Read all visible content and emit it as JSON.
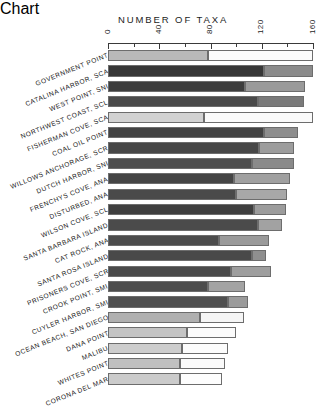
{
  "chart_data": {
    "type": "bar",
    "orientation": "horizontal",
    "stacked": true,
    "title": "NUMBER OF TAXA",
    "xlabel": "NUMBER OF TAXA",
    "ylabel": "",
    "xlim": [
      0,
      160
    ],
    "xticks": [
      0,
      40,
      80,
      120,
      160
    ],
    "xtick_labels": [
      "0",
      "40",
      "80",
      "120",
      "160"
    ],
    "minor_tick_interval": 20,
    "grid": false,
    "legend": "none",
    "categories": [
      "GOVERNMENT POINT",
      "CATALINA HARBOR, SCA",
      "WEST POINT, SNI",
      "NORTHWEST COAST, SCL",
      "FISHERMAN COVE, SCA",
      "COAL OIL POINT",
      "WILLOWS ANCHORAGE, SCR",
      "DUTCH HARBOR, SNI",
      "FRENCHYS COVE, ANA",
      "DISTURBED, ANA",
      "WILSON COVE, SCL",
      "SANTA BARBARA ISLAND",
      "CAT ROCK, ANA",
      "SANTA ROSA ISLAND",
      "PRISONERS COVE, SCR",
      "CROOK POINT, SMI",
      "CUYLER HARBOR, SMI",
      "OCEAN BEACH, SAN DIEGO",
      "DANA POINT",
      "MALIBU",
      "WHITES POINT",
      "CORONA DEL MAR"
    ],
    "series": [
      {
        "name": "segment-1",
        "values": [
          78,
          122,
          107,
          117,
          75,
          122,
          118,
          112,
          98,
          100,
          114,
          117,
          87,
          112,
          96,
          78,
          94,
          72,
          62,
          58,
          56,
          56
        ]
      },
      {
        "name": "segment-2",
        "values": [
          82,
          38,
          47,
          36,
          85,
          26,
          27,
          33,
          44,
          40,
          25,
          19,
          39,
          11,
          31,
          29,
          15,
          34,
          38,
          36,
          35,
          33
        ]
      }
    ],
    "totals": [
      160,
      160,
      154,
      153,
      160,
      148,
      145,
      145,
      142,
      140,
      139,
      136,
      126,
      123,
      127,
      107,
      109,
      106,
      100,
      94,
      91,
      89
    ]
  },
  "bar_styles": [
    {
      "fill1": "#b9b9b9",
      "fill2": "#fbfbfb"
    },
    {
      "fill1": "#373737",
      "fill2": "#8b8b8b"
    },
    {
      "fill1": "#3d3d3d",
      "fill2": "#9a9a9a"
    },
    {
      "fill1": "#4a4a4a",
      "fill2": "#7a7a7a"
    },
    {
      "fill1": "#d2d2d2",
      "fill2": "#fafafa"
    },
    {
      "fill1": "#434343",
      "fill2": "#8e8e8e"
    },
    {
      "fill1": "#474747",
      "fill2": "#9d9d9d"
    },
    {
      "fill1": "#4e4e4e",
      "fill2": "#8a8a8a"
    },
    {
      "fill1": "#454545",
      "fill2": "#a0a0a0"
    },
    {
      "fill1": "#4a4a4a",
      "fill2": "#a8a8a8"
    },
    {
      "fill1": "#3f3f3f",
      "fill2": "#9c9c9c"
    },
    {
      "fill1": "#4b4b4b",
      "fill2": "#a2a2a2"
    },
    {
      "fill1": "#4c4c4c",
      "fill2": "#9a9a9a"
    },
    {
      "fill1": "#494949",
      "fill2": "#8f8f8f"
    },
    {
      "fill1": "#4a4a4a",
      "fill2": "#9e9e9e"
    },
    {
      "fill1": "#4d4d4d",
      "fill2": "#a3a3a3"
    },
    {
      "fill1": "#505050",
      "fill2": "#9b9b9b"
    },
    {
      "fill1": "#b0b0b0",
      "fill2": "#f5f5f5"
    },
    {
      "fill1": "#c4c4c4",
      "fill2": "#fbfbfb"
    },
    {
      "fill1": "#cdcdcd",
      "fill2": "#fcfcfc"
    },
    {
      "fill1": "#c0c0c0",
      "fill2": "#fafafa"
    },
    {
      "fill1": "#cbcbcb",
      "fill2": "#fdfdfd"
    }
  ],
  "axis": {
    "pixel_origin_x": 108,
    "pixel_end_x": 313,
    "value_max": 160
  }
}
